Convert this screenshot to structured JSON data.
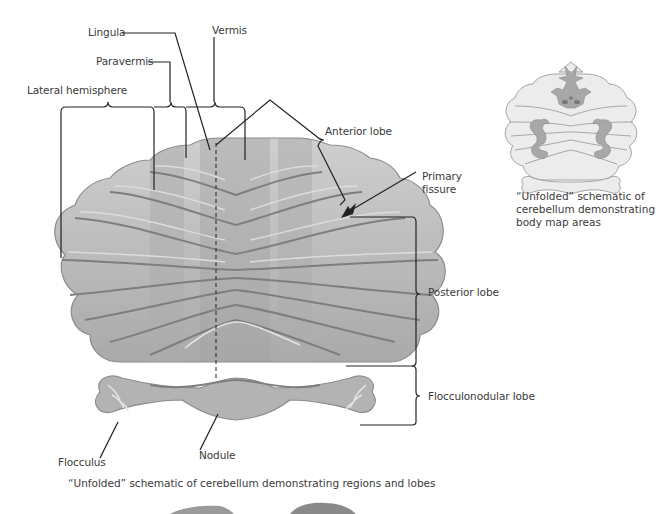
{
  "main_figure": {
    "caption": "“Unfolded” schematic of cerebellum demonstrating regions and lobes",
    "labels": {
      "lingula": "Lingula",
      "vermis": "Vermis",
      "paravermis": "Paravermis",
      "lateral_hemisphere": "Lateral hemisphere",
      "anterior_lobe": "Anterior lobe",
      "primary_fissure_line1": "Primary",
      "primary_fissure_line2": "fissure",
      "posterior_lobe": "Posterior lobe",
      "flocculonodular_lobe": "Flocculonodular lobe",
      "flocculus": "Flocculus",
      "nodule": "Nodule"
    }
  },
  "inset_figure": {
    "caption_line1": "“Unfolded” schematic of",
    "caption_line2": "cerebellum demonstrating",
    "caption_line3": "body map areas"
  },
  "colors": {
    "lobe_fill": "#b8b8b8",
    "lobe_highlight": "#dcdcdc",
    "lobe_shadow": "#8a8a8a",
    "paravermis_band": "#a9a9a9",
    "inset_fill": "#e6e6e6",
    "inset_body_map": "#a8a8a8",
    "line": "#222222",
    "text": "#3a3a3a"
  }
}
